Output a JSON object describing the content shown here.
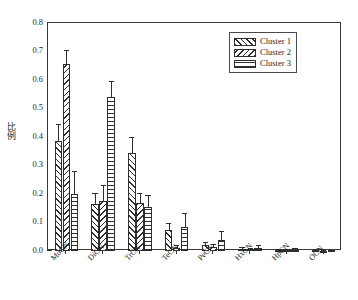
{
  "chart_data": {
    "type": "bar",
    "title": "",
    "xlabel": "",
    "ylabel": "比例",
    "ylim": [
      0.0,
      0.8
    ],
    "ytick_labels": [
      "0.0",
      "0.1",
      "0.2",
      "0.3",
      "0.4",
      "0.5",
      "0.6",
      "0.7",
      "0.8"
    ],
    "ytick_values": [
      0.0,
      0.1,
      0.2,
      0.3,
      0.4,
      0.5,
      0.6,
      0.7,
      0.8
    ],
    "minor_ticks": true,
    "grid": false,
    "legend_position": "top-right",
    "categories": [
      "MoCN",
      "DiCN",
      "TrCN",
      "TeCN",
      "PeCN",
      "HxCN",
      "HpCN",
      "OCN"
    ],
    "series": [
      {
        "name": "Cluster 1",
        "pattern": "forward-diagonal-hatch",
        "values": [
          0.385,
          0.165,
          0.345,
          0.075,
          0.02,
          0.008,
          0.004,
          0.002
        ],
        "errors": [
          0.06,
          0.04,
          0.055,
          0.025,
          0.01,
          0.006,
          0.004,
          0.002
        ]
      },
      {
        "name": "Cluster 2",
        "pattern": "backward-diagonal-hatch",
        "values": [
          0.655,
          0.175,
          0.17,
          0.012,
          0.015,
          0.006,
          0.003,
          0.001
        ],
        "errors": [
          0.05,
          0.055,
          0.035,
          0.008,
          0.008,
          0.005,
          0.003,
          0.001
        ]
      },
      {
        "name": "Cluster 3",
        "pattern": "horizontal-line-hatch",
        "values": [
          0.2,
          0.54,
          0.155,
          0.085,
          0.04,
          0.012,
          0.005,
          0.002
        ],
        "errors": [
          0.08,
          0.055,
          0.04,
          0.05,
          0.03,
          0.01,
          0.004,
          0.002
        ]
      }
    ]
  },
  "legend": {
    "items": [
      {
        "label": "Cluster 1"
      },
      {
        "label": "Cluster 2"
      },
      {
        "label": "Cluster 3"
      }
    ]
  },
  "colors": {
    "axis": "#3a3a3a",
    "bar_outline": "#2e2e2e",
    "background": "#ffffff",
    "text": "#1f1f1f"
  }
}
